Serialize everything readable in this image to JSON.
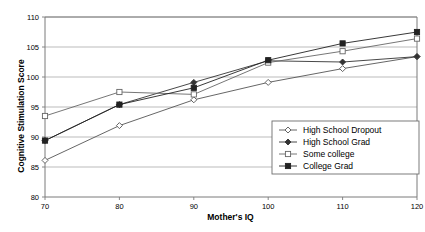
{
  "chart_data": {
    "type": "line",
    "title": "",
    "xlabel": "Mother's IQ",
    "ylabel": "Cognitive Stimulation Score",
    "x": [
      70,
      80,
      90,
      100,
      110,
      120
    ],
    "xtick_labels": [
      "70",
      "80",
      "90",
      "100",
      "110",
      "120"
    ],
    "ytick_labels": [
      "80",
      "85",
      "90",
      "95",
      "100",
      "105",
      "110"
    ],
    "xlim": [
      70,
      120
    ],
    "ylim": [
      80,
      110
    ],
    "ytick_step": 5,
    "grid": "horizontal",
    "legend_position": "inside-lower-right",
    "series": [
      {
        "name": "High School Dropout",
        "marker": "open-diamond",
        "color": "#555555",
        "values": [
          86.1,
          91.9,
          96.2,
          99.1,
          101.4,
          103.4
        ]
      },
      {
        "name": "High School Grad",
        "marker": "filled-diamond",
        "color": "#333333",
        "values": [
          89.4,
          95.4,
          99.1,
          102.7,
          102.5,
          103.4
        ]
      },
      {
        "name": "Some college",
        "marker": "open-square",
        "color": "#666666",
        "values": [
          93.5,
          97.5,
          97.1,
          102.4,
          104.3,
          106.4
        ]
      },
      {
        "name": "College Grad",
        "marker": "filled-square",
        "color": "#222222",
        "values": [
          89.4,
          95.4,
          98.2,
          102.8,
          105.6,
          107.5
        ]
      }
    ]
  },
  "legend": {
    "items": [
      {
        "label": "High School Dropout",
        "marker": "open-diamond"
      },
      {
        "label": "High School Grad",
        "marker": "filled-diamond"
      },
      {
        "label": "Some college",
        "marker": "open-square"
      },
      {
        "label": "College Grad",
        "marker": "filled-square"
      }
    ]
  },
  "axes": {
    "x_title": "Mother's IQ",
    "y_title": "Cognitive Stimulation Score"
  },
  "colors": {
    "axis": "#7a7a7a",
    "grid": "#a9a9a9",
    "text": "#000000",
    "plot_background": "#ffffff"
  }
}
